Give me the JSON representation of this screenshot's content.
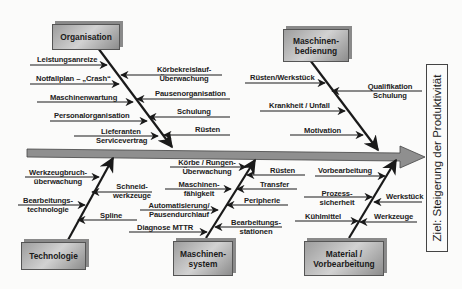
{
  "diagram_type": "Ishikawa fishbone diagram",
  "goal": "Ziel: Steigerung der Produktivität",
  "categories": {
    "organisation": {
      "title": "Organisation",
      "causes_left": [
        "Leistungsanreize",
        "Notfallplan – „Crash“",
        "Maschinenwartung",
        "Personalorganisation",
        "Lieferanten Servicevertrag"
      ],
      "causes_right": [
        "Körbekreislauf-Überwachung",
        "Pausenorganisation",
        "Schulung",
        "Rüsten"
      ]
    },
    "maschinenbedienung": {
      "title": "Maschinen-bedienung",
      "causes_left": [
        "Rüsten/Werkstück",
        "Krankheit / Unfall",
        "Motivation"
      ],
      "causes_right": [
        "Qualifikation Schulung"
      ]
    },
    "technologie": {
      "title": "Technologie",
      "causes_left": [
        "Werkzeugbruch-überwachung",
        "Bearbeitungs-technologie"
      ],
      "causes_right": [
        "Schneid-werkzeuge",
        "Spline"
      ]
    },
    "maschinensystem": {
      "title": "Maschinen-system",
      "causes_left": [
        "Körbe / Rungen-Überwachung",
        "Maschinen-fähigkeit",
        "Automatisierung/ Pausendurchlauf",
        "Diagnose MTTR"
      ],
      "causes_right": [
        "Rüsten",
        "Transfer",
        "Peripherie",
        "Bearbeitungs-stationen"
      ]
    },
    "material": {
      "title": "Material / Vorbearbeitung",
      "causes_left": [
        "Vorbearbeitung",
        "Prozess-sicherheit",
        "Kühlmittel"
      ],
      "causes_right": [
        "Werkstück",
        "Werkzeuge"
      ]
    }
  },
  "labels": {
    "org_box": "Organisation",
    "mb_box_1": "Maschinen-",
    "mb_box_2": "bedienung",
    "tech_box": "Technologie",
    "ms_box_1": "Maschinen-",
    "ms_box_2": "system",
    "mat_box_1": "Material /",
    "mat_box_2": "Vorbearbeitung",
    "leistungsanreize": "Leistungsanreize",
    "notfallplan": "Notfallplan – „Crash“",
    "maschinenwartung": "Maschinenwartung",
    "personalorganisation": "Personalorganisation",
    "lieferanten_1": "Lieferanten",
    "lieferanten_2": "Servicevertrag",
    "koerbekreislauf_1": "Körbekreislauf-",
    "koerbekreislauf_2": "Überwachung",
    "pausenorganisation": "Pausenorganisation",
    "schulung": "Schulung",
    "ruesten_org": "Rüsten",
    "ruesten_werkstueck": "Rüsten/Werkstück",
    "krankheit": "Krankheit / Unfall",
    "motivation": "Motivation",
    "qualifikation_1": "Qualifikation",
    "qualifikation_2": "Schulung",
    "werkzeugbruch_1": "Werkzeugbruch-",
    "werkzeugbruch_2": "überwachung",
    "bearbeitungstech_1": "Bearbeitungs-",
    "bearbeitungstech_2": "technologie",
    "schneid_1": "Schneid-",
    "schneid_2": "werkzeuge",
    "spline": "Spline",
    "koerbe_1": "Körbe / Rungen-",
    "koerbe_2": "Überwachung",
    "maschinenf_1": "Maschinen-",
    "maschinenf_2": "fähigkeit",
    "automatisierung_1": "Automatisierung/",
    "automatisierung_2": "Pausendurchlauf",
    "diagnose": "Diagnose MTTR",
    "ruesten_ms": "Rüsten",
    "transfer": "Transfer",
    "peripherie": "Peripherie",
    "bearbstationen_1": "Bearbeitungs-",
    "bearbstationen_2": "stationen",
    "vorbearbeitung": "Vorbearbeitung",
    "prozess_1": "Prozess-",
    "prozess_2": "sicherheit",
    "kuehlmittel": "Kühlmittel",
    "werkstueck": "Werkstück",
    "werkzeuge": "Werkzeuge"
  },
  "colors": {
    "spine": "#8f8f8f",
    "box_fill": "#b8b8b8",
    "line": "#1a1a1a",
    "background": "#fbfbfa"
  }
}
